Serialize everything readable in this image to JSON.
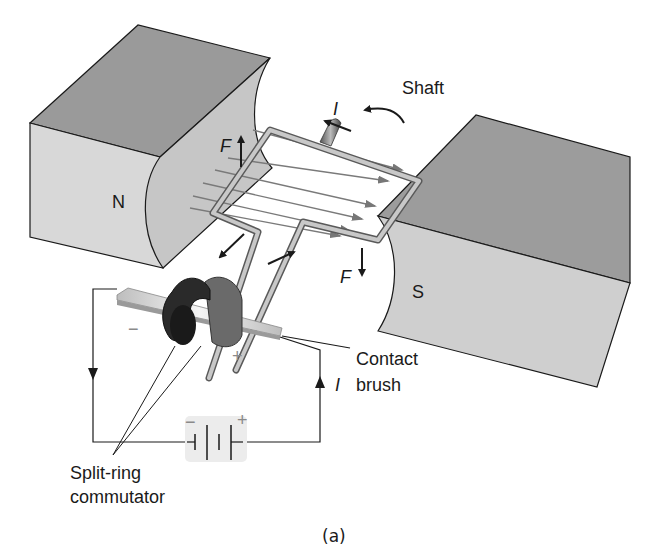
{
  "figure": {
    "caption": "(a)"
  },
  "labels": {
    "north_pole": "N",
    "south_pole": "S",
    "shaft": "Shaft",
    "force_left": "F",
    "force_right": "F",
    "current_top": "I",
    "current_circuit": "I",
    "contact_brush_line1": "Contact",
    "contact_brush_line2": "brush",
    "commutator_line1": "Split-ring",
    "commutator_line2": "commutator",
    "brush_minus": "−",
    "brush_plus": "+",
    "battery_minus": "−",
    "battery_plus": "+"
  },
  "colors": {
    "magnet_top": "#9a9a9a",
    "magnet_front": "#d6d6d6",
    "magnet_face": "#c4c4c4",
    "wire": "#b0b0b0",
    "field_line": "#7a7a7a",
    "commutator_dark": "#2a2a2a",
    "commutator_gray": "#6a6a6a",
    "brush": "#cfcfcf",
    "battery_bg": "#ececec",
    "outline": "#1a1a1a"
  }
}
